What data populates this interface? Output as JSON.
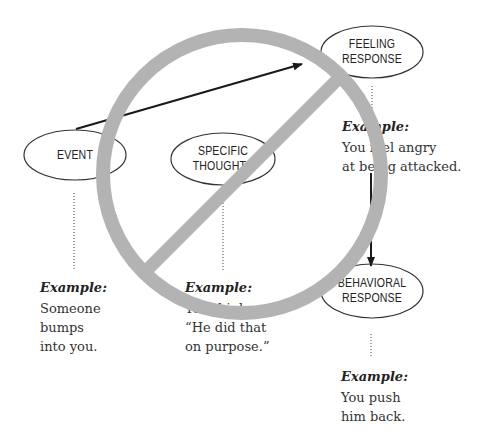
{
  "diagram": {
    "nodes": {
      "event": {
        "line1": "EVENT"
      },
      "specific_thoughts": {
        "line1": "SPECIFIC",
        "line2": "THOUGHTS"
      },
      "feeling_response": {
        "line1": "FEELING",
        "line2": "RESPONSE"
      },
      "behavioral_response": {
        "line1": "BEHAVIORAL",
        "line2": "RESPONSE"
      }
    },
    "examples": {
      "event": {
        "label": "Example:",
        "lines": [
          "Someone",
          "bumps",
          "into you."
        ]
      },
      "specific_thoughts": {
        "label": "Example:",
        "lines": [
          "You think,",
          "“He did that",
          "on purpose.”"
        ]
      },
      "feeling_response": {
        "label": "Example:",
        "lines": [
          "You feel angry",
          "at being attacked."
        ]
      },
      "behavioral_response": {
        "label": "Example:",
        "lines": [
          "You push",
          "him back."
        ]
      }
    },
    "arrows": [
      {
        "from": "event",
        "to": "feeling_response"
      },
      {
        "from": "feeling_response",
        "to": "behavioral_response"
      }
    ],
    "overlay": {
      "symbol": "prohibition-sign",
      "color": "#b3b3b3",
      "covers": "specific_thoughts"
    },
    "colors": {
      "ink": "#222222",
      "prohibition": "#b3b3b3",
      "background": "#ffffff"
    }
  }
}
